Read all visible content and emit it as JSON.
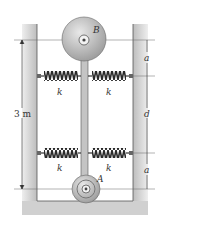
{
  "figure": {
    "labels": {
      "disk_top": "B",
      "disk_bottom": "A",
      "spring_constant": "k",
      "overall_height": "3 m",
      "dim_top": "a",
      "dim_middle": "d",
      "dim_bottom": "a"
    },
    "springs": [
      {
        "label": "k",
        "position": "upper-left"
      },
      {
        "label": "k",
        "position": "upper-right"
      },
      {
        "label": "k",
        "position": "lower-left"
      },
      {
        "label": "k",
        "position": "lower-right"
      }
    ],
    "colors": {
      "wall": "#cfcfcf",
      "disk": "#b9b9b9",
      "spring": "#3a3a3a",
      "line": "#444444"
    }
  }
}
